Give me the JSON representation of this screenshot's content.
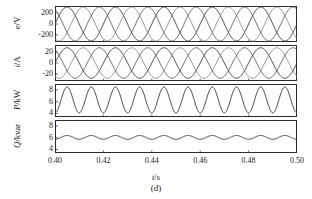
{
  "figure": {
    "caption": "(d)",
    "xlabel_symbol": "t",
    "xlabel_unit": "/s"
  },
  "chart_data": {
    "type": "line",
    "title": "",
    "caption": "(d)",
    "xlabel": "t/s",
    "xlim": [
      0.4,
      0.5
    ],
    "xticks": [
      0.4,
      0.42,
      0.44,
      0.46,
      0.48,
      0.5
    ],
    "xticklabels": [
      "0.40",
      "0.42",
      "0.44",
      "0.46",
      "0.48",
      "0.50"
    ],
    "grid": false,
    "legend": "none",
    "colors": {
      "phase_a": "#3a3a3a",
      "phase_b": "#8c8c8c",
      "phase_c": "#5e5e5e",
      "power": "#3a3a3a",
      "frame": "#2b2b2b"
    },
    "panels": [
      {
        "id": "voltage",
        "ylabel": "e/V",
        "ylabel_symbol": "e",
        "ylabel_unit": "/V",
        "ylim": [
          -330,
          330
        ],
        "yticks": [
          200,
          0,
          -200
        ],
        "yticklabels": [
          "200",
          "0",
          "-200"
        ],
        "waveform": "three-phase-sine",
        "frequency_hz": 50,
        "amplitude": 311,
        "offset": 0,
        "phase_offsets_deg": [
          0,
          -120,
          -240
        ],
        "series": [
          {
            "name": "e_a",
            "color": "#3a3a3a",
            "amplitude": 311,
            "phase_deg": 0
          },
          {
            "name": "e_b",
            "color": "#8c8c8c",
            "amplitude": 311,
            "phase_deg": -120
          },
          {
            "name": "e_c",
            "color": "#5e5e5e",
            "amplitude": 311,
            "phase_deg": -240
          }
        ]
      },
      {
        "id": "current",
        "ylabel": "i/A",
        "ylabel_symbol": "i",
        "ylabel_unit": "/A",
        "ylim": [
          -33,
          33
        ],
        "yticks": [
          20,
          0,
          -20
        ],
        "yticklabels": [
          "20",
          "0",
          "-20"
        ],
        "waveform": "three-phase-sine",
        "frequency_hz": 50,
        "amplitude": 28,
        "offset": 0,
        "phase_offsets_deg": [
          0,
          -120,
          -240
        ],
        "series": [
          {
            "name": "i_a",
            "color": "#3a3a3a",
            "amplitude": 28,
            "phase_deg": 0
          },
          {
            "name": "i_b",
            "color": "#8c8c8c",
            "amplitude": 28,
            "phase_deg": -120
          },
          {
            "name": "i_c",
            "color": "#5e5e5e",
            "amplitude": 28,
            "phase_deg": -240
          }
        ]
      },
      {
        "id": "active-power",
        "ylabel": "P/kW",
        "ylabel_symbol": "P",
        "ylabel_unit": "/kW",
        "ylim": [
          3.4,
          9.0
        ],
        "yticks": [
          8,
          6,
          4
        ],
        "yticklabels": [
          "8",
          "6",
          "4"
        ],
        "waveform": "ripple-sine",
        "frequency_hz": 100,
        "mean": 6.3,
        "amplitude": 2.2,
        "series": [
          {
            "name": "P",
            "color": "#3a3a3a",
            "mean": 6.3,
            "amplitude": 2.2,
            "frequency_hz": 100
          }
        ]
      },
      {
        "id": "reactive-power",
        "ylabel": "Q/kvar",
        "ylabel_symbol": "Q",
        "ylabel_unit": "/kvar",
        "ylim": [
          3.4,
          9.0
        ],
        "yticks": [
          8,
          6,
          4
        ],
        "yticklabels": [
          "8",
          "6",
          "4"
        ],
        "waveform": "ripple-sine",
        "frequency_hz": 100,
        "mean": 6.05,
        "amplitude": 0.32,
        "series": [
          {
            "name": "Q",
            "color": "#3a3a3a",
            "mean": 6.05,
            "amplitude": 0.32,
            "frequency_hz": 100
          }
        ]
      }
    ]
  }
}
